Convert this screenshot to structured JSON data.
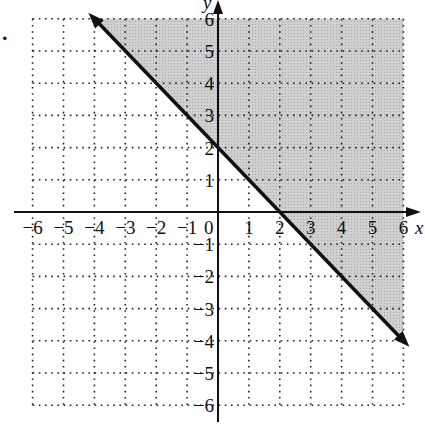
{
  "problem_marker": ".",
  "chart_data": {
    "type": "line",
    "title": "",
    "xlabel": "x",
    "ylabel": "y",
    "xlim": [
      -6,
      6
    ],
    "ylim": [
      -6,
      6
    ],
    "grid": "dotted",
    "x_ticks": [
      -6,
      -5,
      -4,
      -3,
      -2,
      -1,
      0,
      1,
      2,
      3,
      4,
      5,
      6
    ],
    "y_ticks": [
      -6,
      -5,
      -4,
      -3,
      -2,
      -1,
      1,
      2,
      3,
      4,
      5,
      6
    ],
    "x_tick_labels": [
      "−6",
      "−5",
      "−4",
      "−3",
      "−2",
      "−1",
      "0",
      "1",
      "2",
      "3",
      "4",
      "5",
      "6"
    ],
    "y_tick_labels": [
      "6",
      "5",
      "4",
      "3",
      "2",
      "1",
      "−1",
      "−2",
      "−3",
      "−4",
      "−5",
      "−6"
    ],
    "series": [
      {
        "name": "boundary line y = -x + 2",
        "style": "solid",
        "arrows": "both",
        "x": [
          -4,
          6
        ],
        "y": [
          6,
          -4
        ]
      }
    ],
    "shaded_region": {
      "inequality": "y >= -x + 2",
      "side": "above",
      "vertices": [
        [
          -4,
          6
        ],
        [
          6,
          6
        ],
        [
          6,
          -4
        ]
      ],
      "color": "#c8c8c8"
    },
    "intercepts": {
      "x_intercept": 2,
      "y_intercept": 2
    }
  }
}
